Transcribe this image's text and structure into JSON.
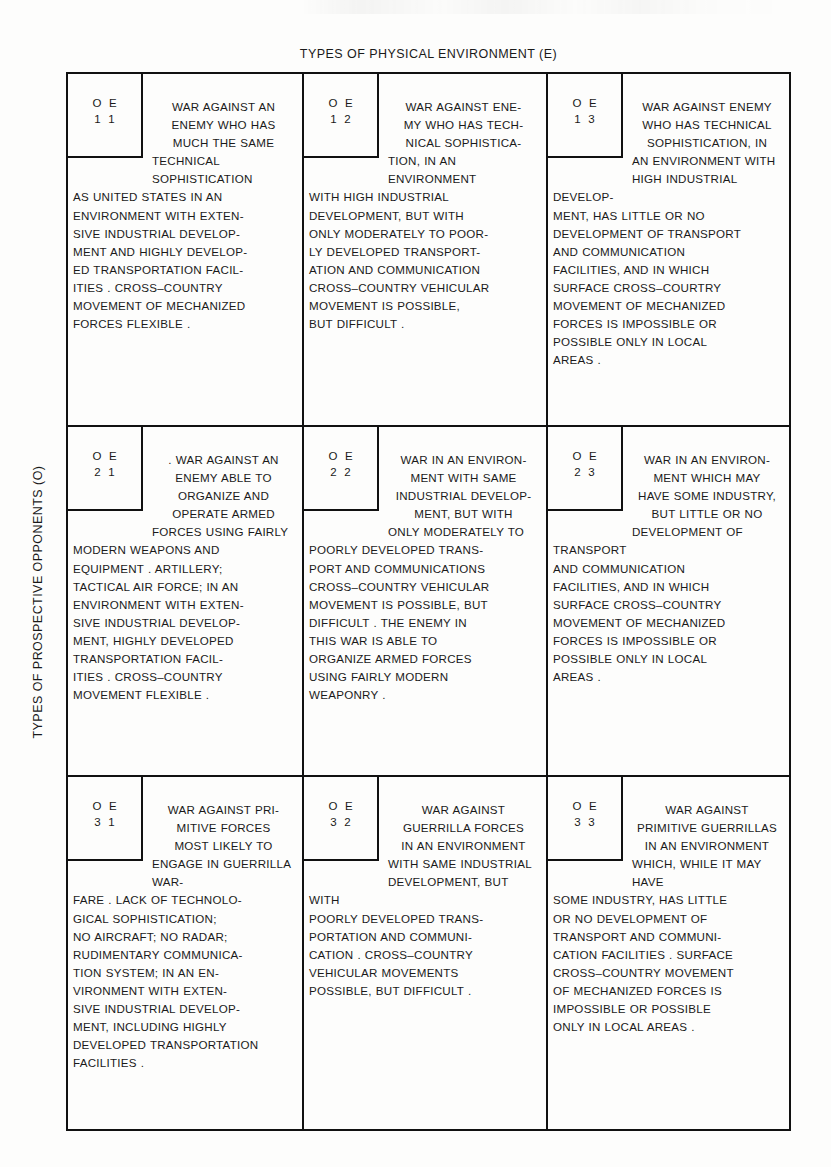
{
  "axes": {
    "column_title": "TYPES OF PHYSICAL ENVIRONMENT (E)",
    "row_title": "TYPES OF PROSPECTIVE OPPONENTS (O)"
  },
  "matrix": {
    "code_header": "O E",
    "cells": [
      {
        "code": "O E",
        "index": "1 1",
        "lead_lines": [
          "WAR AGAINST AN",
          "ENEMY WHO HAS",
          "MUCH THE SAME"
        ],
        "body_lines": [
          "TECHNICAL SOPHISTICATION",
          "AS UNITED STATES IN AN",
          "ENVIRONMENT WITH EXTEN-",
          "SIVE INDUSTRIAL DEVELOP-",
          "MENT AND HIGHLY DEVELOP-",
          "ED TRANSPORTATION FACIL-",
          "ITIES .  CROSS–COUNTRY",
          "MOVEMENT OF MECHANIZED",
          "FORCES FLEXIBLE ."
        ]
      },
      {
        "code": "O E",
        "index": "1 2",
        "lead_lines": [
          "WAR AGAINST ENE-",
          "MY WHO HAS TECH-",
          "NICAL SOPHISTICA-"
        ],
        "body_lines": [
          "TION, IN AN ENVIRONMENT",
          "WITH HIGH INDUSTRIAL",
          "DEVELOPMENT, BUT WITH",
          "ONLY MODERATELY TO POOR-",
          "LY DEVELOPED TRANSPORT-",
          "ATION AND COMMUNICATION",
          "CROSS–COUNTRY VEHICULAR",
          "MOVEMENT IS POSSIBLE,",
          "BUT DIFFICULT ."
        ]
      },
      {
        "code": "O E",
        "index": "1 3",
        "lead_lines": [
          "WAR AGAINST ENEMY",
          "WHO HAS TECHNICAL",
          "SOPHISTICATION, IN"
        ],
        "body_lines": [
          "AN ENVIRONMENT WITH",
          "HIGH INDUSTRIAL DEVELOP-",
          "MENT, HAS LITTLE OR NO",
          "DEVELOPMENT OF TRANSPORT",
          "AND COMMUNICATION",
          "FACILITIES, AND IN WHICH",
          "SURFACE CROSS–COURTRY",
          "MOVEMENT OF MECHANIZED",
          "FORCES IS IMPOSSIBLE OR",
          "POSSIBLE ONLY IN LOCAL",
          "AREAS ."
        ]
      },
      {
        "code": "O E",
        "index": "2 1",
        "lead_lines": [
          ". WAR AGAINST AN",
          "ENEMY ABLE TO",
          "ORGANIZE AND",
          "OPERATE ARMED"
        ],
        "body_lines": [
          "FORCES USING FAIRLY",
          "MODERN WEAPONS AND",
          "EQUIPMENT .  ARTILLERY;",
          "TACTICAL AIR FORCE; IN AN",
          "ENVIRONMENT WITH EXTEN-",
          "SIVE INDUSTRIAL DEVELOP-",
          "MENT, HIGHLY DEVELOPED",
          "TRANSPORTATION FACIL-",
          "ITIES .  CROSS–COUNTRY",
          "MOVEMENT FLEXIBLE ."
        ]
      },
      {
        "code": "O E",
        "index": "2 2",
        "lead_lines": [
          "WAR IN AN ENVIRON-",
          "MENT WITH SAME",
          "INDUSTRIAL DEVELOP-",
          "MENT, BUT WITH"
        ],
        "body_lines": [
          "ONLY MODERATELY TO",
          "POORLY DEVELOPED TRANS-",
          "PORT AND COMMUNICATIONS",
          "CROSS–COUNTRY VEHICULAR",
          "MOVEMENT IS POSSIBLE, BUT",
          "DIFFICULT .  THE ENEMY IN",
          "THIS WAR IS ABLE TO",
          "ORGANIZE ARMED FORCES",
          "USING FAIRLY MODERN",
          "WEAPONRY ."
        ]
      },
      {
        "code": "O E",
        "index": "2 3",
        "lead_lines": [
          "WAR IN AN ENVIRON-",
          "MENT WHICH MAY",
          "HAVE SOME INDUSTRY,",
          "BUT LITTLE OR NO"
        ],
        "body_lines": [
          "DEVELOPMENT OF TRANSPORT",
          "AND COMMUNICATION",
          "FACILITIES, AND IN WHICH",
          "SURFACE CROSS–COUNTRY",
          "MOVEMENT OF MECHANIZED",
          "FORCES IS IMPOSSIBLE OR",
          "POSSIBLE ONLY IN LOCAL",
          "AREAS ."
        ]
      },
      {
        "code": "O E",
        "index": "3 1",
        "lead_lines": [
          "WAR AGAINST PRI-",
          "MITIVE FORCES",
          "MOST LIKELY TO"
        ],
        "body_lines": [
          "ENGAGE IN GUERRILLA WAR-",
          "FARE .  LACK OF TECHNOLO-",
          "GICAL SOPHISTICATION;",
          "NO AIRCRAFT; NO RADAR;",
          "RUDIMENTARY COMMUNICA-",
          "TION SYSTEM; IN AN EN-",
          "VIRONMENT WITH EXTEN-",
          "SIVE INDUSTRIAL DEVELOP-",
          "MENT, INCLUDING HIGHLY",
          "DEVELOPED TRANSPORTATION",
          "FACILITIES ."
        ]
      },
      {
        "code": "O E",
        "index": "3 2",
        "lead_lines": [
          "WAR AGAINST",
          "GUERRILLA FORCES",
          "IN AN ENVIRONMENT"
        ],
        "body_lines": [
          "WITH SAME INDUSTRIAL",
          "DEVELOPMENT, BUT WITH",
          "POORLY DEVELOPED TRANS-",
          "PORTATION AND COMMUNI-",
          "CATION .  CROSS–COUNTRY",
          "VEHICULAR MOVEMENTS",
          "POSSIBLE, BUT DIFFICULT ."
        ]
      },
      {
        "code": "O E",
        "index": "3 3",
        "lead_lines": [
          "WAR AGAINST",
          "PRIMITIVE GUERRILLAS",
          "IN AN ENVIRONMENT"
        ],
        "body_lines": [
          "WHICH, WHILE IT MAY HAVE",
          "SOME INDUSTRY, HAS LITTLE",
          "OR NO DEVELOPMENT OF",
          "TRANSPORT AND COMMUNI-",
          "CATION FACILITIES . SURFACE",
          "CROSS–COUNTRY MOVEMENT",
          "OF MECHANIZED FORCES IS",
          "IMPOSSIBLE OR POSSIBLE",
          "ONLY IN LOCAL AREAS ."
        ]
      }
    ]
  }
}
